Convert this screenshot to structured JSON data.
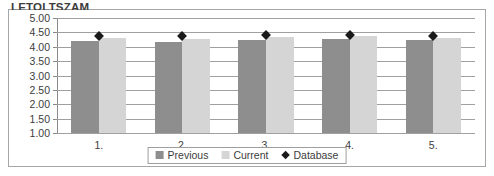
{
  "chart_object": {
    "title": "LETOLTSZAM"
  },
  "legend": {
    "position": "bottom-center",
    "entries": [
      {
        "label": "Previous",
        "icon": "square-swatch-icon",
        "color": "#8e8e8e",
        "type": "bar"
      },
      {
        "label": "Current",
        "icon": "square-swatch-icon",
        "color": "#d5d5d5",
        "type": "bar"
      },
      {
        "label": "Database",
        "icon": "diamond-marker-icon",
        "color": "#1a1a1a",
        "type": "marker"
      }
    ]
  },
  "chart_data": {
    "type": "bar",
    "title": "LETOLTSZAM",
    "xlabel": "",
    "ylabel": "",
    "ylim": [
      1.0,
      5.0
    ],
    "ytick_step": 0.5,
    "ytick_labels": [
      "5.00",
      "4.50",
      "4.00",
      "3.50",
      "3.00",
      "2.50",
      "2.00",
      "1.50",
      "1.00"
    ],
    "ytick_values": [
      5.0,
      4.5,
      4.0,
      3.5,
      3.0,
      2.5,
      2.0,
      1.5,
      1.0
    ],
    "grid": true,
    "categories": [
      "1.",
      "2.",
      "3.",
      "4.",
      "5."
    ],
    "series": [
      {
        "name": "Previous",
        "type": "bar",
        "color": "#8e8e8e",
        "values": [
          4.2,
          4.17,
          4.22,
          4.28,
          4.22
        ]
      },
      {
        "name": "Current",
        "type": "bar",
        "color": "#d5d5d5",
        "values": [
          4.3,
          4.27,
          4.33,
          4.38,
          4.3
        ]
      },
      {
        "name": "Database",
        "type": "marker",
        "color": "#1a1a1a",
        "values": [
          4.38,
          4.38,
          4.4,
          4.42,
          4.38
        ]
      }
    ]
  }
}
